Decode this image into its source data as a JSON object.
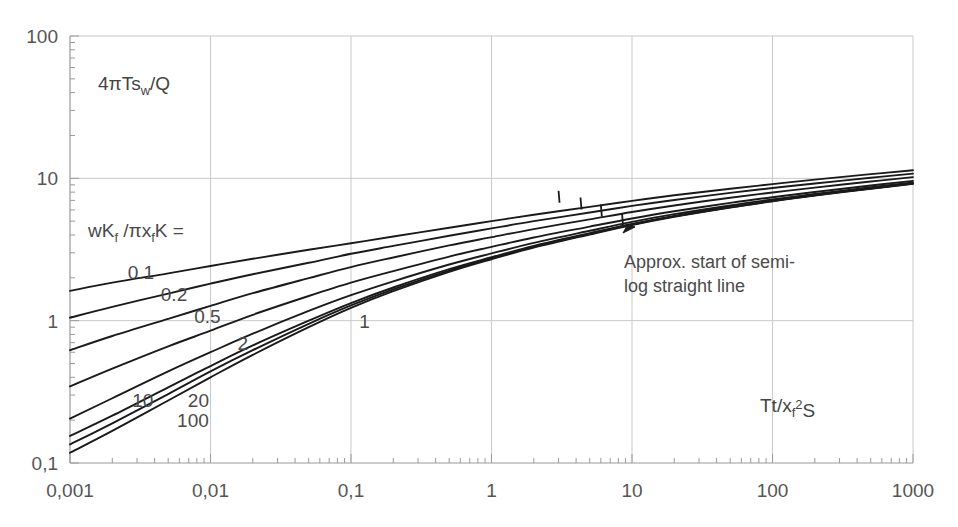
{
  "chart_data": {
    "type": "line",
    "title": "",
    "xlabel": "Tt/xf2S",
    "xlabel_parts": {
      "pre": "Tt/x",
      "sub": "f",
      "sup": "2",
      "post": "S"
    },
    "ylabel": "4πTsw/Q",
    "ylabel_parts": {
      "pre": "4πTs",
      "sub": "w",
      "post": "/Q"
    },
    "xscale": "log",
    "yscale": "log",
    "xlim": [
      0.001,
      1000
    ],
    "ylim": [
      0.1,
      100
    ],
    "grid": true,
    "grid_major_only": true,
    "legend_position": "inline-curve-labels",
    "xticks": [
      "0,001",
      "0,01",
      "0,1",
      "1",
      "10",
      "100",
      "1000"
    ],
    "xtick_values": [
      0.001,
      0.01,
      0.1,
      1,
      10,
      100,
      1000
    ],
    "yticks": [
      "0,1",
      "1",
      "10",
      "100"
    ],
    "ytick_values": [
      0.1,
      1,
      10,
      100
    ],
    "series_header": "wKf /πxfK =",
    "series_header_parts": {
      "a": "wK",
      "sub1": "f",
      "b": " /πx",
      "sub2": "f",
      "c": "K ="
    },
    "series": [
      {
        "name": "0.1",
        "label": "0.1",
        "label_x": 0.0032,
        "label_y": 2.2,
        "x": [
          0.001,
          0.002,
          0.005,
          0.01,
          0.02,
          0.05,
          0.1,
          0.2,
          0.5,
          1,
          2,
          5,
          10,
          20,
          50,
          100,
          200,
          500,
          1000
        ],
        "values": [
          1.62,
          1.85,
          2.15,
          2.42,
          2.72,
          3.15,
          3.5,
          3.9,
          4.5,
          5.0,
          5.55,
          6.3,
          6.95,
          7.6,
          8.45,
          9.1,
          9.8,
          10.7,
          11.4
        ]
      },
      {
        "name": "0.2",
        "label": "0.2",
        "label_x": 0.0055,
        "label_y": 1.55,
        "x": [
          0.001,
          0.002,
          0.005,
          0.01,
          0.02,
          0.05,
          0.1,
          0.2,
          0.5,
          1,
          2,
          5,
          10,
          20,
          50,
          100,
          200,
          500,
          1000
        ],
        "values": [
          1.05,
          1.25,
          1.55,
          1.82,
          2.12,
          2.55,
          2.95,
          3.35,
          3.95,
          4.45,
          5.0,
          5.75,
          6.4,
          7.05,
          7.9,
          8.55,
          9.2,
          10.1,
          10.8
        ]
      },
      {
        "name": "0.5",
        "label": "0.5",
        "label_x": 0.0095,
        "label_y": 1.08,
        "x": [
          0.001,
          0.002,
          0.005,
          0.01,
          0.02,
          0.05,
          0.1,
          0.2,
          0.5,
          1,
          2,
          5,
          10,
          20,
          50,
          100,
          200,
          500,
          1000
        ],
        "values": [
          0.62,
          0.78,
          1.03,
          1.27,
          1.56,
          1.99,
          2.38,
          2.78,
          3.38,
          3.86,
          4.4,
          5.15,
          5.8,
          6.45,
          7.3,
          7.95,
          8.6,
          9.5,
          10.2
        ]
      },
      {
        "name": "1",
        "label": "1",
        "label_x": 0.125,
        "label_y": 1.0,
        "x": [
          0.001,
          0.002,
          0.005,
          0.01,
          0.02,
          0.05,
          0.1,
          0.2,
          0.5,
          1,
          2,
          5,
          10,
          20,
          50,
          100,
          200,
          500,
          1000
        ],
        "values": [
          0.345,
          0.46,
          0.66,
          0.85,
          1.1,
          1.49,
          1.85,
          2.23,
          2.82,
          3.3,
          3.84,
          4.58,
          5.22,
          5.87,
          6.72,
          7.37,
          8.02,
          8.9,
          9.6
        ]
      },
      {
        "name": "2",
        "label": "2",
        "label_x": 0.017,
        "label_y": 0.7,
        "x": [
          0.001,
          0.002,
          0.005,
          0.01,
          0.02,
          0.05,
          0.1,
          0.2,
          0.5,
          1,
          2,
          5,
          10,
          20,
          50,
          100,
          200,
          500,
          1000
        ],
        "values": [
          0.205,
          0.285,
          0.44,
          0.6,
          0.81,
          1.17,
          1.51,
          1.89,
          2.48,
          2.97,
          3.52,
          4.28,
          4.94,
          5.6,
          6.45,
          7.1,
          7.77,
          8.65,
          9.35
        ]
      },
      {
        "name": "10",
        "label": "10",
        "label_x": 0.0033,
        "label_y": 0.275,
        "x": [
          0.001,
          0.002,
          0.005,
          0.01,
          0.02,
          0.05,
          0.1,
          0.2,
          0.5,
          1,
          2,
          5,
          10,
          20,
          50,
          100,
          200,
          500,
          1000
        ],
        "values": [
          0.155,
          0.215,
          0.34,
          0.48,
          0.67,
          1.0,
          1.33,
          1.71,
          2.3,
          2.79,
          3.35,
          4.12,
          4.79,
          5.45,
          6.31,
          6.97,
          7.64,
          8.52,
          9.22
        ]
      },
      {
        "name": "20",
        "label": "20",
        "label_x": 0.0082,
        "label_y": 0.275,
        "x": [
          0.001,
          0.002,
          0.005,
          0.01,
          0.02,
          0.05,
          0.1,
          0.2,
          0.5,
          1,
          2,
          5,
          10,
          20,
          50,
          100,
          200,
          500,
          1000
        ],
        "values": [
          0.135,
          0.19,
          0.305,
          0.44,
          0.62,
          0.95,
          1.28,
          1.66,
          2.25,
          2.74,
          3.3,
          4.07,
          4.74,
          5.4,
          6.27,
          6.93,
          7.6,
          8.48,
          9.18
        ]
      },
      {
        "name": "100",
        "label": "100",
        "label_x": 0.0075,
        "label_y": 0.2,
        "x": [
          0.001,
          0.002,
          0.005,
          0.01,
          0.02,
          0.05,
          0.1,
          0.2,
          0.5,
          1,
          2,
          5,
          10,
          20,
          50,
          100,
          200,
          500,
          1000
        ],
        "values": [
          0.118,
          0.168,
          0.275,
          0.4,
          0.575,
          0.9,
          1.23,
          1.61,
          2.2,
          2.7,
          3.26,
          4.03,
          4.7,
          5.37,
          6.24,
          6.9,
          7.57,
          8.45,
          9.15
        ]
      }
    ],
    "annotations": [
      {
        "text_line1": "Approx. start of semi-",
        "text_line2": "log straight line",
        "x": 3.6,
        "y": 1.45,
        "markers": [
          {
            "x": 3.0,
            "y": 7.3
          },
          {
            "x": 4.3,
            "y": 6.55
          },
          {
            "x": 6.0,
            "y": 5.85
          },
          {
            "x": 8.5,
            "y": 5.0
          }
        ]
      }
    ]
  },
  "style": {
    "curve_color": "#1a1a1a",
    "grid_color": "#c9c9c9",
    "axis_color": "#9a9a9a",
    "text_color": "#4a4a4a",
    "background": "#ffffff"
  }
}
